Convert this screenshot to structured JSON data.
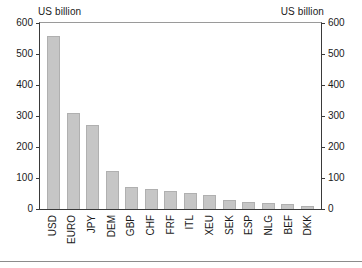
{
  "chart_data": {
    "type": "bar",
    "title": "",
    "left_axis_title": "US billion",
    "right_axis_title": "US billion",
    "xlabel": "",
    "ylabel": "US billion",
    "ylim": [
      0,
      600
    ],
    "yticks": [
      0,
      100,
      200,
      300,
      400,
      500,
      600
    ],
    "ytick_labels": [
      "0",
      "100",
      "200",
      "300",
      "400",
      "500",
      "600"
    ],
    "grid": false,
    "legend": null,
    "dual_axis": true,
    "bar_color": "#c6c6c6",
    "bar_edge_color": "#b0b0b0",
    "categories": [
      "USD",
      "EURO",
      "JPY",
      "DEM",
      "GBP",
      "CHF",
      "FRF",
      "ITL",
      "XEU",
      "SEK",
      "ESP",
      "NLG",
      "BEF",
      "DKK"
    ],
    "values": [
      558,
      310,
      272,
      122,
      70,
      63,
      57,
      51,
      45,
      29,
      22,
      20,
      15,
      10
    ]
  }
}
